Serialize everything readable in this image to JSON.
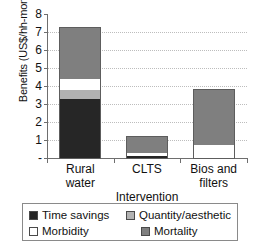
{
  "chart_data": {
    "type": "bar",
    "title": "",
    "subtitle": "",
    "xlabel": "Intervention",
    "ylabel": "Benefits (US$/hh-month)",
    "categories": [
      "Rural water",
      "CLTS",
      "Bios and filters"
    ],
    "category_lines": [
      [
        "Rural",
        "water"
      ],
      [
        "CLTS"
      ],
      [
        "Bios and",
        "filters"
      ]
    ],
    "stacked": true,
    "ylim": [
      0,
      8
    ],
    "yticks": [
      0,
      1,
      2,
      3,
      4,
      5,
      6,
      7,
      8
    ],
    "ytick_labels": [
      "-",
      "1",
      "2",
      "3",
      "4",
      "5",
      "6",
      "7",
      "8"
    ],
    "grid": "horizontal-dotted",
    "legend_position": "below-plot",
    "series": [
      {
        "name": "Time savings",
        "color": "#262626",
        "values": [
          3.3,
          0.12,
          0.0
        ]
      },
      {
        "name": "Quantity/aesthetic",
        "color": "#b2b2b2",
        "values": [
          0.5,
          0.0,
          0.0
        ]
      },
      {
        "name": "Morbidity",
        "color": "#ffffff",
        "values": [
          0.6,
          0.18,
          0.7
        ]
      },
      {
        "name": "Mortality",
        "color": "#7f7f7f",
        "values": [
          2.8,
          0.85,
          3.1
        ]
      }
    ],
    "totals": [
      7.2,
      1.15,
      3.8
    ]
  }
}
